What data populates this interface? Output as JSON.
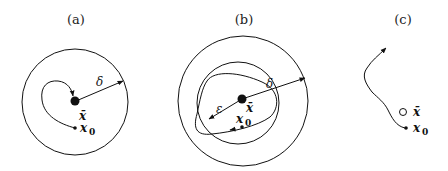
{
  "panels": [
    {
      "id": "a",
      "title": "(a)",
      "labels": {
        "equilibrium": "x̄",
        "initial": "x",
        "initial_sub": "0",
        "radius": "δ"
      },
      "description": "Trajectory starting at x0 inside a delta-ball stays near and converges to the equilibrium x-bar"
    },
    {
      "id": "b",
      "title": "(b)",
      "labels": {
        "equilibrium": "x̄",
        "initial": "x",
        "initial_sub": "0",
        "outer_radius": "δ",
        "inner_radius": "ε"
      },
      "description": "Trajectory from x0 in an epsilon-ball remains within the delta-ball (closed orbit)"
    },
    {
      "id": "c",
      "title": "(c)",
      "labels": {
        "equilibrium": "x̄",
        "initial": "x",
        "initial_sub": "0"
      },
      "description": "Trajectory from x0 diverges away from the unstable equilibrium x-bar"
    }
  ],
  "colors": {
    "stroke": "#111111",
    "background": "#ffffff"
  }
}
